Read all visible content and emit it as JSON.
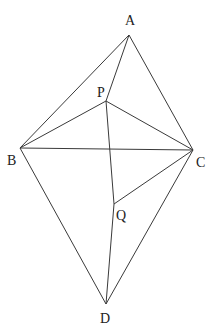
{
  "figure": {
    "type": "geometry",
    "points": {
      "A": {
        "label": "A",
        "x": 129,
        "y": 35,
        "label_x": 125,
        "label_y": 25
      },
      "P": {
        "label": "P",
        "x": 106,
        "y": 101,
        "label_x": 97,
        "label_y": 97
      },
      "B": {
        "label": "B",
        "x": 20,
        "y": 148,
        "label_x": 7,
        "label_y": 165
      },
      "C": {
        "label": "C",
        "x": 193,
        "y": 150,
        "label_x": 196,
        "label_y": 167
      },
      "Q": {
        "label": "Q",
        "x": 114,
        "y": 204,
        "label_x": 116,
        "label_y": 220
      },
      "D": {
        "label": "D",
        "x": 106,
        "y": 304,
        "label_x": 100,
        "label_y": 323
      }
    },
    "segments": [
      [
        "A",
        "B"
      ],
      [
        "A",
        "C"
      ],
      [
        "A",
        "P"
      ],
      [
        "P",
        "B"
      ],
      [
        "P",
        "C"
      ],
      [
        "B",
        "C"
      ],
      [
        "P",
        "Q"
      ],
      [
        "Q",
        "D"
      ],
      [
        "Q",
        "C"
      ],
      [
        "B",
        "D"
      ],
      [
        "C",
        "D"
      ]
    ],
    "line_color": "#3a3a3a",
    "label_color": "#222222"
  }
}
